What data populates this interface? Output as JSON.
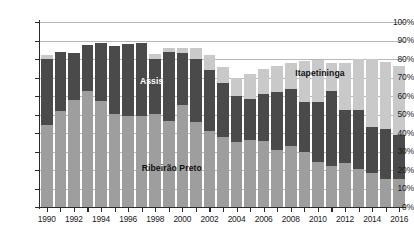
{
  "chart_data": {
    "type": "bar",
    "subtype": "stacked-bar-percent",
    "title": "",
    "xlabel": "",
    "ylabel": "",
    "ylim": [
      0,
      100
    ],
    "y_unit": "%",
    "grid": true,
    "legend_position": "in-plot-annotations",
    "categories": [
      "1990",
      "1991",
      "1992",
      "1993",
      "1994",
      "1995",
      "1996",
      "1997",
      "1998",
      "1999",
      "2000",
      "2001",
      "2002",
      "2003",
      "2004",
      "2005",
      "2006",
      "2007",
      "2008",
      "2009",
      "2010",
      "2011",
      "2012",
      "2013",
      "2014",
      "2015",
      "2016"
    ],
    "ytick_labels": [
      "0%",
      "10%",
      "20%",
      "30%",
      "40%",
      "50%",
      "60%",
      "70%",
      "80%",
      "90%",
      "100%"
    ],
    "ytick_values": [
      0,
      10,
      20,
      30,
      40,
      50,
      60,
      70,
      80,
      90,
      100
    ],
    "xtick_labels": [
      "1990",
      "1992",
      "1994",
      "1996",
      "1998",
      "2000",
      "2002",
      "2004",
      "2006",
      "2008",
      "2010",
      "2012",
      "2014",
      "2016"
    ],
    "series": [
      {
        "name": "Ribeirão Preto",
        "color": "#9e9e9e",
        "values": [
          44.5,
          52.0,
          58.0,
          62.5,
          57.5,
          50.5,
          49.0,
          49.0,
          50.5,
          46.5,
          55.0,
          46.0,
          41.0,
          38.0,
          35.0,
          36.0,
          35.5,
          31.0,
          33.0,
          29.5,
          24.5,
          22.0,
          24.0,
          20.5,
          18.5,
          15.0,
          15.0
        ]
      },
      {
        "name": "Assis",
        "color": "#4a4a4a",
        "values": [
          35.5,
          32.0,
          25.0,
          25.0,
          31.0,
          36.5,
          39.0,
          39.5,
          29.5,
          37.5,
          28.5,
          34.0,
          33.0,
          29.0,
          25.0,
          22.5,
          25.5,
          31.0,
          31.0,
          27.5,
          32.5,
          40.5,
          28.5,
          32.0,
          24.5,
          27.0,
          24.0
        ]
      },
      {
        "name": "Itapetininga",
        "color": "#c9c9c9",
        "values": [
          2.0,
          0.0,
          0.0,
          0.0,
          0.0,
          0.0,
          0.0,
          0.0,
          2.5,
          2.0,
          2.5,
          6.0,
          8.0,
          8.5,
          10.0,
          13.5,
          13.5,
          14.5,
          14.0,
          22.0,
          22.5,
          15.5,
          25.5,
          27.5,
          37.0,
          36.5,
          37.0
        ]
      }
    ],
    "cumulative_tops": {
      "ribeirao_preto": [
        44.5,
        52.0,
        58.0,
        62.5,
        57.5,
        50.5,
        49.0,
        49.0,
        50.5,
        46.5,
        55.0,
        46.0,
        41.0,
        38.0,
        35.0,
        36.0,
        35.5,
        31.0,
        33.0,
        29.5,
        24.5,
        22.0,
        24.0,
        20.5,
        18.5,
        15.0,
        15.0
      ],
      "assis": [
        80.0,
        84.0,
        83.0,
        87.5,
        88.5,
        87.0,
        88.0,
        88.5,
        80.0,
        84.0,
        83.5,
        80.0,
        74.0,
        67.0,
        60.0,
        58.5,
        61.0,
        62.0,
        64.0,
        57.0,
        57.0,
        62.5,
        52.5,
        52.5,
        43.0,
        42.0,
        39.0
      ],
      "itapetininga": [
        82.0,
        84.0,
        83.0,
        87.5,
        88.5,
        87.0,
        88.0,
        88.5,
        82.5,
        86.0,
        86.0,
        86.0,
        82.0,
        75.5,
        70.0,
        72.0,
        74.5,
        76.5,
        78.0,
        79.0,
        79.5,
        78.0,
        78.0,
        80.0,
        80.0,
        78.5,
        76.0
      ]
    },
    "annotations": [
      {
        "text": "Assis",
        "series": "Assis",
        "x_pct": 30.5,
        "y_pct": 68.0,
        "color": "#ffffff"
      },
      {
        "text": "Ribeirão Preto",
        "series": "Ribeirão Preto",
        "x_pct": 36.0,
        "y_pct": 21.0,
        "color": "#111111"
      },
      {
        "text": "Itapetininga",
        "series": "Itapetininga",
        "x_pct": 76.5,
        "y_pct": 72.5,
        "color": "#111111"
      }
    ]
  }
}
